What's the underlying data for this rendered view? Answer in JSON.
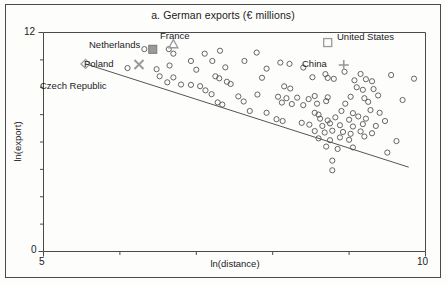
{
  "chart_data": {
    "type": "scatter",
    "title": "a. German exports (€ millions)",
    "xlabel": "ln(distance)",
    "ylabel": "ln(export)",
    "xlim": [
      5,
      10
    ],
    "ylim": [
      0,
      12
    ],
    "xticks": [
      5,
      6,
      7,
      8,
      9,
      10
    ],
    "xtick_labels": [
      "5",
      "",
      "",
      "",
      "",
      "10"
    ],
    "yticks": [
      0,
      1.5,
      3,
      4.5,
      6,
      7.5,
      9,
      10.5,
      12
    ],
    "ytick_labels": [
      "0",
      "",
      "",
      "",
      "",
      "",
      "",
      "",
      "12"
    ],
    "grid": false,
    "legend": "none",
    "trendline": {
      "name": "fitted regression line",
      "x": [
        5.55,
        9.78
      ],
      "y": [
        10.28,
        4.62
      ]
    },
    "series": [
      {
        "name": "countries",
        "marker": "open-circle",
        "points": [
          [
            6.32,
            11.09
          ],
          [
            6.64,
            11.09
          ],
          [
            6.7,
            10.84
          ],
          [
            7.11,
            10.84
          ],
          [
            7.31,
            11.0
          ],
          [
            7.79,
            10.9
          ],
          [
            6.93,
            10.44
          ],
          [
            7.21,
            10.44
          ],
          [
            8.1,
            10.35
          ],
          [
            8.22,
            10.28
          ],
          [
            6.65,
            10.19
          ],
          [
            7.63,
            10.44
          ],
          [
            8.4,
            10.08
          ],
          [
            6.1,
            10.05
          ],
          [
            6.48,
            9.99
          ],
          [
            7.0,
            9.96
          ],
          [
            7.38,
            10.09
          ],
          [
            7.92,
            10.02
          ],
          [
            8.69,
            9.72
          ],
          [
            8.94,
            9.85
          ],
          [
            9.15,
            9.73
          ],
          [
            9.55,
            9.67
          ],
          [
            6.52,
            9.6
          ],
          [
            6.7,
            9.54
          ],
          [
            7.25,
            9.6
          ],
          [
            7.3,
            9.49
          ],
          [
            7.86,
            9.52
          ],
          [
            8.52,
            9.55
          ],
          [
            8.72,
            9.51
          ],
          [
            8.8,
            9.46
          ],
          [
            9.07,
            9.38
          ],
          [
            9.22,
            9.44
          ],
          [
            9.3,
            9.33
          ],
          [
            9.85,
            9.47
          ],
          [
            6.62,
            9.27
          ],
          [
            6.8,
            9.15
          ],
          [
            6.93,
            9.13
          ],
          [
            7.05,
            9.06
          ],
          [
            7.4,
            9.3
          ],
          [
            7.45,
            9.18
          ],
          [
            8.15,
            9.05
          ],
          [
            8.23,
            8.93
          ],
          [
            9.1,
            9.0
          ],
          [
            9.18,
            8.86
          ],
          [
            9.32,
            8.9
          ],
          [
            7.12,
            8.83
          ],
          [
            7.2,
            8.62
          ],
          [
            7.55,
            8.5
          ],
          [
            7.8,
            8.6
          ],
          [
            8.07,
            8.48
          ],
          [
            8.18,
            8.4
          ],
          [
            8.32,
            8.43
          ],
          [
            8.47,
            8.35
          ],
          [
            8.55,
            8.52
          ],
          [
            8.72,
            8.45
          ],
          [
            9.02,
            8.48
          ],
          [
            9.2,
            8.4
          ],
          [
            9.38,
            8.55
          ],
          [
            9.7,
            8.3
          ],
          [
            7.28,
            8.17
          ],
          [
            7.34,
            8.05
          ],
          [
            7.62,
            8.22
          ],
          [
            8.12,
            8.16
          ],
          [
            8.25,
            8.08
          ],
          [
            8.4,
            8.02
          ],
          [
            8.58,
            8.1
          ],
          [
            8.7,
            8.24
          ],
          [
            8.95,
            8.1
          ],
          [
            9.25,
            8.2
          ],
          [
            7.7,
            7.7
          ],
          [
            7.92,
            7.6
          ],
          [
            8.55,
            7.6
          ],
          [
            8.6,
            7.5
          ],
          [
            8.9,
            7.7
          ],
          [
            9.05,
            7.58
          ],
          [
            9.28,
            7.75
          ],
          [
            9.4,
            7.6
          ],
          [
            8.05,
            7.25
          ],
          [
            8.13,
            7.15
          ],
          [
            8.62,
            7.28
          ],
          [
            8.72,
            7.18
          ],
          [
            8.82,
            7.35
          ],
          [
            9.0,
            7.22
          ],
          [
            9.12,
            7.4
          ],
          [
            9.22,
            7.28
          ],
          [
            9.47,
            7.15
          ],
          [
            8.38,
            7.05
          ],
          [
            8.48,
            6.95
          ],
          [
            8.65,
            6.88
          ],
          [
            8.75,
            7.02
          ],
          [
            8.88,
            6.92
          ],
          [
            9.05,
            6.85
          ],
          [
            9.18,
            6.98
          ],
          [
            9.35,
            6.88
          ],
          [
            8.55,
            6.6
          ],
          [
            8.68,
            6.52
          ],
          [
            8.78,
            6.62
          ],
          [
            8.92,
            6.55
          ],
          [
            9.02,
            6.45
          ],
          [
            9.15,
            6.58
          ],
          [
            9.3,
            6.48
          ],
          [
            8.6,
            6.2
          ],
          [
            8.75,
            6.1
          ],
          [
            8.88,
            6.25
          ],
          [
            9.0,
            6.12
          ],
          [
            9.2,
            6.3
          ],
          [
            9.62,
            6.05
          ],
          [
            8.7,
            5.75
          ],
          [
            8.85,
            5.62
          ],
          [
            9.05,
            5.7
          ],
          [
            9.5,
            5.42
          ],
          [
            8.78,
            4.98
          ],
          [
            8.78,
            4.45
          ]
        ]
      },
      {
        "name": "highlighted countries",
        "points": [
          {
            "label": "Netherlands",
            "x": 6.43,
            "y": 11.08,
            "marker": "filled-square"
          },
          {
            "label": "France",
            "x": 6.7,
            "y": 11.35,
            "marker": "triangle"
          },
          {
            "label": "Poland",
            "x": 6.25,
            "y": 10.25,
            "marker": "cross-x"
          },
          {
            "label": "Czech Republic",
            "x": 5.55,
            "y": 10.28,
            "marker": "diamond"
          },
          {
            "label": "United States",
            "x": 8.72,
            "y": 11.45,
            "marker": "open-square"
          },
          {
            "label": "China",
            "x": 8.93,
            "y": 10.22,
            "marker": "plus"
          }
        ]
      }
    ],
    "annotations": [
      {
        "text": "Netherlands",
        "x_px": 89,
        "y_px": 39
      },
      {
        "text": "France",
        "x_px": 160,
        "y_px": 30
      },
      {
        "text": "Poland",
        "x_px": 84,
        "y_px": 58
      },
      {
        "text": "Czech Republic",
        "x_px": 40,
        "y_px": 80
      },
      {
        "text": "United States",
        "x_px": 337,
        "y_px": 31
      },
      {
        "text": "China",
        "x_px": 302,
        "y_px": 58
      }
    ],
    "colors": {
      "axis": "#4a4a4a",
      "marker_stroke": "#555555",
      "highlight": "#9a9a9a",
      "trendline": "#555555",
      "text": "#1b1b1b",
      "background": "#fdfdfc"
    }
  }
}
